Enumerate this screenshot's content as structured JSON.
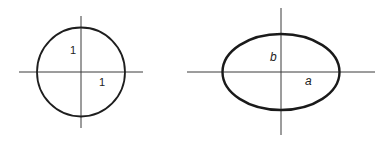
{
  "figures": [
    {
      "name": "unit-circle",
      "shape": "circle",
      "center": [
        81,
        72
      ],
      "radius_x": 44,
      "radius_y": 44.5,
      "labels": {
        "vertical_radius": "1",
        "horizontal_radius": "1"
      }
    },
    {
      "name": "ellipse",
      "shape": "ellipse",
      "center": [
        281,
        72
      ],
      "radius_x": 58.5,
      "radius_y": 38,
      "labels": {
        "semi_minor_axis": "b",
        "semi_major_axis": "a"
      }
    }
  ],
  "colors": {
    "background": "#ffffff",
    "stroke": "#1e1e1e",
    "axis": "#3a3a3a"
  }
}
